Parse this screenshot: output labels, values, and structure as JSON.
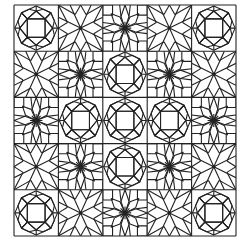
{
  "image": {
    "title": "Geometric line-art tile pattern",
    "description": "5x5 grid of black outlined geometric tiles on white: square-in-octagon tiles (A), dense 8-petal flower tiles (B), and simple 8-point star tiles (C)"
  },
  "grid": {
    "x0": 14,
    "y0": 5,
    "x1": 236,
    "y1": 236,
    "cols": 5,
    "rows": 5,
    "stroke": "#222222",
    "background": "#ffffff",
    "layout": [
      [
        "A",
        "C",
        "B",
        "C",
        "A"
      ],
      [
        "C",
        "B",
        "A",
        "B",
        "C"
      ],
      [
        "B",
        "A",
        "A",
        "A",
        "B"
      ],
      [
        "C",
        "B",
        "A",
        "B",
        "C"
      ],
      [
        "A",
        "C",
        "B",
        "C",
        "A"
      ]
    ]
  },
  "tile_types": {
    "A": "square-in-octagon with kite ring",
    "B": "dense 8-petal flower",
    "C": "simple 8-point star"
  }
}
